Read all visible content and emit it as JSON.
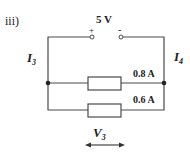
{
  "question_label": "iii)",
  "source": {
    "voltage_label": "5 V",
    "positive_label": "+",
    "negative_label": "-"
  },
  "branches": [
    {
      "current_label": "0.8 A"
    },
    {
      "current_label": "0.6 A"
    }
  ],
  "labels": {
    "left_current": {
      "symbol": "I",
      "subscript": "3"
    },
    "right_current": {
      "symbol": "I",
      "subscript": "4"
    },
    "voltage": {
      "symbol": "V",
      "subscript": "3"
    }
  },
  "colors": {
    "wire": "#4a4a4a",
    "background": "#ffffff"
  }
}
